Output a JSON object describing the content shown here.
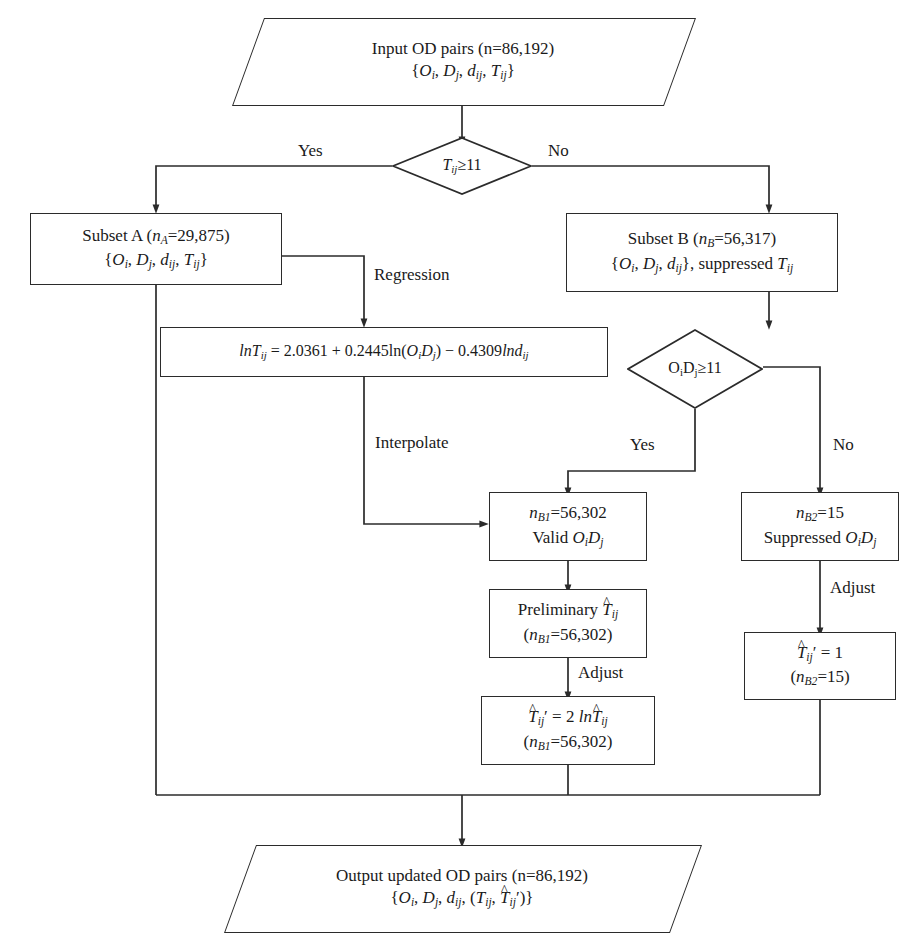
{
  "diagram": {
    "type": "flowchart",
    "line_color": "#2b2b2b",
    "background": "#ffffff"
  },
  "nodes": {
    "input": {
      "shape": "parallelogram",
      "line1": "Input OD pairs (n=86,192)",
      "line2_parts": [
        "{",
        "O",
        "i",
        ", ",
        "D",
        "j",
        ", ",
        "d",
        "ij",
        ", ",
        "T",
        "ij",
        "}"
      ]
    },
    "decision_t": {
      "shape": "diamond",
      "label_lhs": "T",
      "label_sub": "ij",
      "label_rhs": "≥11"
    },
    "subset_a": {
      "shape": "rect",
      "line1_pre": "Subset A (",
      "line1_n": "n",
      "line1_sub": "A",
      "line1_post": "=29,875)",
      "line2": "{O i , D j , d ij , T ij }"
    },
    "subset_b": {
      "shape": "rect",
      "line1_pre": "Subset B (",
      "line1_n": "n",
      "line1_sub": "B",
      "line1_post": "=56,317)",
      "line2_suffix": ", suppressed"
    },
    "regression_eq": {
      "shape": "rect",
      "equation": "lnT_ij = 2.0361 + 0.2445ln(O_iD_j) − 0.4309lnd_ij",
      "coef_intercept": "2.0361",
      "coef_mass": "0.2445",
      "coef_distance": "-0.4309"
    },
    "decision_od": {
      "shape": "diamond",
      "label_lhs": "O",
      "label_sub_i": "i",
      "label_mid": "D",
      "label_sub_j": "j",
      "label_rhs": "≥11"
    },
    "valid_od": {
      "shape": "rect",
      "line1_n": "n",
      "line1_sub": "B1",
      "line1_post": "=56,302",
      "line2": "Valid O i D j"
    },
    "suppressed_od": {
      "shape": "rect",
      "line1_n": "n",
      "line1_sub": "B2",
      "line1_post": "=15",
      "line2": "Suppressed O i D j"
    },
    "preliminary_t": {
      "shape": "rect",
      "line1": "Preliminary T̂ ij",
      "line2_n": "n",
      "line2_sub": "B1",
      "line2_post": "=56,302"
    },
    "adjusted_t": {
      "shape": "rect",
      "line1": "T̂′ ij = 2 lnT̂ ij",
      "line2_n": "n",
      "line2_sub": "B1",
      "line2_post": "=56,302"
    },
    "unit_t": {
      "shape": "rect",
      "line1": "T̂′ ij = 1",
      "line1_value": "1",
      "line2_n": "n",
      "line2_sub": "B2",
      "line2_post": "=15"
    },
    "output": {
      "shape": "parallelogram",
      "line1": "Output updated OD pairs (n=86,192)",
      "line2": "{O i , D j , d ij , (T ij , T̂′ ij )}"
    }
  },
  "edge_labels": {
    "yes_top": "Yes",
    "no_top": "No",
    "regression": "Regression",
    "interpolate": "Interpolate",
    "yes_od": "Yes",
    "no_od": "No",
    "adjust_left": "Adjust",
    "adjust_right": "Adjust"
  },
  "counts": {
    "total_pairs": "86,192",
    "subset_a": "29,875",
    "subset_b": "56,317",
    "valid_b1": "56,302",
    "suppressed_b2": "15",
    "threshold": "11"
  }
}
